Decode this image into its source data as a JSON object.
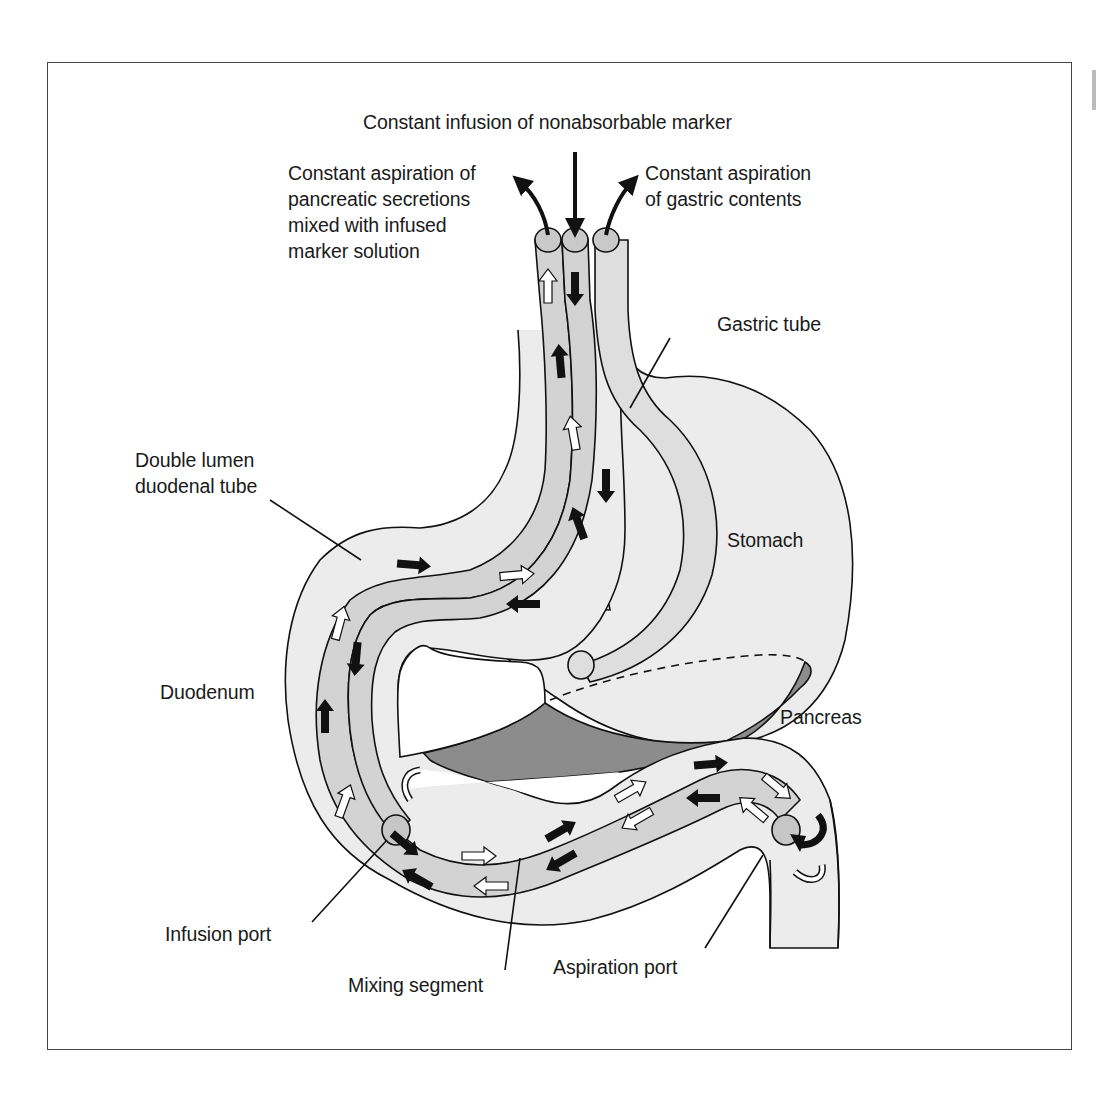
{
  "figure": {
    "colors": {
      "background": "#ffffff",
      "outline": "#111111",
      "organ_fill": "#ececec",
      "tube_fill": "#d3d3d3",
      "tube_light": "#dedede",
      "pancreas_fill": "#8c8c8c",
      "arrow_dark": "#111111",
      "arrow_light": "#ffffff"
    }
  },
  "labels": {
    "infusion_marker": "Constant infusion of nonabsorbable marker",
    "aspiration_pancreatic": "Constant aspiration of\npancreatic secretions\nmixed with infused\nmarker solution",
    "aspiration_gastric": "Constant aspiration\nof gastric contents",
    "gastric_tube": "Gastric tube",
    "double_lumen": "Double lumen\nduodenal tube",
    "stomach": "Stomach",
    "duodenum": "Duodenum",
    "pancreas": "Pancreas",
    "infusion_port": "Infusion port",
    "mixing_segment": "Mixing segment",
    "aspiration_port": "Aspiration port"
  },
  "icons": {
    "flow_arrow_dark": "black-flow-arrow",
    "flow_arrow_light": "white-flow-arrow",
    "curved_arrow": "curved-flow-arrow"
  }
}
